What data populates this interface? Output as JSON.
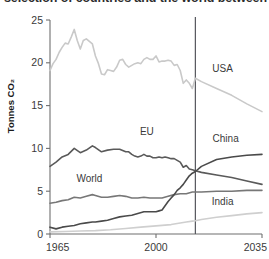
{
  "title": {
    "text": "selection of countries and the world between",
    "truncated": true
  },
  "chart_data": {
    "type": "line",
    "title": "selection of countries and the world between",
    "xlabel": "",
    "ylabel": "Tonnes CO₂",
    "xlim": [
      1965,
      2035
    ],
    "ylim": [
      0,
      25
    ],
    "xticks": [
      "1965",
      "2000",
      "2035"
    ],
    "xtick_values": [
      1965,
      2000,
      2035
    ],
    "yticks": [
      "0",
      "5",
      "10",
      "15",
      "20",
      "25"
    ],
    "ytick_values": [
      0,
      5,
      10,
      15,
      20,
      25
    ],
    "grid": false,
    "legend": "inline-labels",
    "annotations": [
      {
        "name": "projection-divider",
        "type": "vline",
        "x": 2013,
        "label": ""
      }
    ],
    "series": [
      {
        "name": "USA",
        "color": "#c9c9c9",
        "label_x": 2022,
        "label_y": 18.9,
        "x": [
          1965,
          1966,
          1967,
          1968,
          1969,
          1970,
          1971,
          1972,
          1973,
          1974,
          1975,
          1976,
          1977,
          1978,
          1979,
          1980,
          1981,
          1982,
          1983,
          1984,
          1985,
          1986,
          1987,
          1988,
          1989,
          1990,
          1991,
          1992,
          1993,
          1994,
          1995,
          1996,
          1997,
          1998,
          1999,
          2000,
          2001,
          2002,
          2003,
          2004,
          2005,
          2006,
          2007,
          2008,
          2009,
          2010,
          2011,
          2012,
          2013,
          2015,
          2020,
          2025,
          2030,
          2035
        ],
        "values": [
          19.1,
          19.9,
          20.4,
          21.2,
          21.8,
          22.3,
          22.2,
          23.0,
          23.9,
          22.6,
          21.6,
          22.6,
          22.8,
          22.5,
          22.2,
          20.8,
          19.9,
          18.7,
          18.6,
          19.2,
          19.1,
          19.0,
          19.5,
          20.3,
          20.4,
          19.8,
          19.5,
          19.7,
          19.9,
          20.0,
          19.9,
          20.4,
          20.6,
          20.4,
          20.4,
          20.8,
          20.1,
          20.2,
          20.2,
          20.3,
          20.2,
          19.7,
          19.8,
          19.1,
          17.6,
          18.0,
          17.6,
          17.0,
          18.2,
          17.8,
          17.0,
          16.2,
          15.2,
          14.3
        ]
      },
      {
        "name": "EU",
        "color": "#5a5a5a",
        "label_x": 1997,
        "label_y": 11.6,
        "x": [
          1965,
          1967,
          1969,
          1971,
          1973,
          1975,
          1977,
          1979,
          1980,
          1982,
          1984,
          1986,
          1988,
          1990,
          1991,
          1992,
          1993,
          1994,
          1995,
          1996,
          1997,
          1998,
          1999,
          2000,
          2001,
          2002,
          2003,
          2004,
          2005,
          2006,
          2007,
          2008,
          2009,
          2010,
          2011,
          2012,
          2013,
          2015,
          2020,
          2025,
          2030,
          2035
        ],
        "values": [
          7.9,
          8.4,
          9.0,
          9.3,
          10.0,
          9.5,
          9.8,
          10.3,
          10.1,
          9.6,
          9.8,
          9.9,
          9.9,
          9.6,
          9.6,
          9.3,
          9.1,
          9.0,
          9.1,
          9.3,
          9.1,
          9.1,
          8.9,
          8.9,
          9.0,
          8.9,
          9.0,
          8.9,
          8.8,
          8.8,
          8.6,
          8.4,
          7.8,
          8.0,
          7.6,
          7.5,
          7.4,
          7.2,
          6.9,
          6.6,
          6.2,
          5.8
        ]
      },
      {
        "name": "World",
        "color": "#777777",
        "label_x": 1978,
        "label_y": 6.1,
        "x": [
          1965,
          1967,
          1969,
          1971,
          1973,
          1975,
          1977,
          1979,
          1980,
          1982,
          1984,
          1986,
          1988,
          1990,
          1992,
          1994,
          1996,
          1998,
          2000,
          2002,
          2004,
          2006,
          2008,
          2010,
          2012,
          2013,
          2015,
          2020,
          2025,
          2030,
          2035
        ],
        "values": [
          3.6,
          3.7,
          3.9,
          4.0,
          4.3,
          4.2,
          4.4,
          4.6,
          4.5,
          4.3,
          4.3,
          4.4,
          4.5,
          4.4,
          4.2,
          4.2,
          4.3,
          4.2,
          4.2,
          4.2,
          4.4,
          4.6,
          4.7,
          4.7,
          4.9,
          4.9,
          4.9,
          5.0,
          5.0,
          5.1,
          5.1
        ]
      },
      {
        "name": "China",
        "color": "#4a4a4a",
        "label_x": 2023,
        "label_y": 10.7,
        "x": [
          1965,
          1967,
          1969,
          1971,
          1973,
          1975,
          1977,
          1979,
          1980,
          1982,
          1984,
          1986,
          1988,
          1990,
          1992,
          1994,
          1996,
          1998,
          2000,
          2001,
          2002,
          2003,
          2004,
          2005,
          2006,
          2007,
          2008,
          2009,
          2010,
          2011,
          2012,
          2013,
          2015,
          2020,
          2025,
          2030,
          2035
        ],
        "values": [
          0.8,
          0.6,
          0.8,
          0.9,
          1.0,
          1.2,
          1.3,
          1.4,
          1.4,
          1.5,
          1.6,
          1.8,
          2.0,
          2.1,
          2.2,
          2.4,
          2.6,
          2.6,
          2.6,
          2.7,
          2.8,
          3.3,
          3.8,
          4.2,
          4.6,
          5.1,
          5.4,
          5.8,
          6.3,
          6.8,
          7.1,
          7.3,
          7.9,
          8.7,
          9.0,
          9.2,
          9.3
        ]
      },
      {
        "name": "India",
        "color": "#cfcfcf",
        "label_x": 2022,
        "label_y": 3.4,
        "x": [
          1965,
          1970,
          1975,
          1980,
          1985,
          1990,
          1995,
          2000,
          2005,
          2010,
          2012,
          2013,
          2015,
          2020,
          2025,
          2030,
          2035
        ],
        "values": [
          0.25,
          0.3,
          0.35,
          0.4,
          0.5,
          0.65,
          0.8,
          0.95,
          1.1,
          1.4,
          1.5,
          1.55,
          1.7,
          1.95,
          2.15,
          2.35,
          2.5
        ]
      }
    ]
  },
  "colors": {
    "axis": "#6f6f6f",
    "divider": "#55565c",
    "text": "#3a3a3a",
    "background": "#ffffff"
  }
}
